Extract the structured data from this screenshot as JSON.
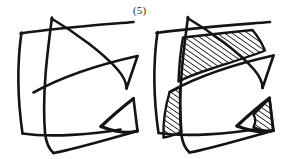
{
  "figure": {
    "label": "(5)",
    "label_position": {
      "x": 133,
      "y": 4
    },
    "background_color": "#ffffff",
    "ink_color": "#141414",
    "canvas": {
      "width": 297,
      "height": 159
    },
    "panels": [
      {
        "name": "left-panel",
        "title": "unshaded-arrangement",
        "shaded": false,
        "bounds": {
          "x": 14,
          "y": 18,
          "width": 130,
          "height": 136
        },
        "curve_count": 4,
        "hatched_region_count": 0
      },
      {
        "name": "right-panel",
        "title": "shaded-arrangement",
        "shaded": true,
        "bounds": {
          "x": 150,
          "y": 16,
          "width": 143,
          "height": 138
        },
        "curve_count": 4,
        "hatched_region_count": 3,
        "hatch_angle_degrees": 55,
        "hatch_spacing_px": 4
      }
    ],
    "hatched_regions": [
      {
        "name": "upper-large-region",
        "panel": "right-panel",
        "approx_center": {
          "x": 210,
          "y": 55
        }
      },
      {
        "name": "middle-sliver-region",
        "panel": "right-panel",
        "approx_center": {
          "x": 173,
          "y": 113
        }
      },
      {
        "name": "right-small-triangle-region",
        "panel": "right-panel",
        "approx_center": {
          "x": 268,
          "y": 116
        }
      }
    ],
    "strokes": {
      "left_panel": {
        "left_vertical_curve": "M21.5,32.5 C17.5,60 17.0,95 22.5,133.5",
        "top_curve": "M20.5,33.5 C55,28 105,24.5 133.5,22.0",
        "descending_curve_top_right": "M51.5,18.5 C76,33 103,53 118,70 C124,77 126.5,82 126.5,88.5",
        "right_upper_arrow": "M91.5,60.5 C110,58 126.5,57 137.5,56.5 L126.5,88.5 C122,80 112,71 99,65.5",
        "long_diagonal": "M33.5,92.5 C58,79 92,66 137.0,56.5",
        "inner_vertical_curve": "M52.0,17.5 C47.0,55 42.0,95 45.0,133.0 C46.0,142 49.5,149.5 53.5,153.0",
        "bottom_curve": "M22.5,133.5 C50,137 94,134 120.5,129.0",
        "lower_arrow": "M101.0,126.5 C112,116 124,106 133.5,98.5 L137.5,131.0 C129,133.5 115,132 101.0,126.5",
        "bottom_sweep": "M53.5,153.0 C75,149 105,140 137.5,131.0"
      },
      "right_panel": {
        "left_vertical_curve": "M157.5,32.0 C153.5,60 153.0,95 158.5,133.0",
        "top_curve": "M156.5,33.0 C191,28 241,24.5 270.0,22.0",
        "descending_curve_top_right": "M187.5,18.0 C212,32.5 239,52.5 254,69.5 C260,76.5 262.5,81.5 262.5,88.0",
        "right_upper_arrow": "M227.5,60.0 C263,57.5 273.5,56.5 274.0,56.0 L262.5,88.0 C258,80 248,71 235,65.0",
        "long_diagonal": "M169.5,92.0 C194,78.5 228,65.5 273.5,56.0",
        "inner_vertical_curve": "M188.0,17.0 C183.0,54.5 178.0,94.5 181.0,132.5 C182.0,141.5 185.5,149 189.5,152.5",
        "bottom_curve": "M158.5,133.0 C186,136.5 230,133.5 256.5,128.5",
        "lower_arrow": "M237.0,126.0 C248,115.5 260,105.5 269.5,98.0 L273.5,130.5 C265,133 251,131.5 237.0,126.0",
        "bottom_sweep": "M189.5,152.5 C211,148.5 241,139.5 273.5,130.5"
      }
    }
  }
}
